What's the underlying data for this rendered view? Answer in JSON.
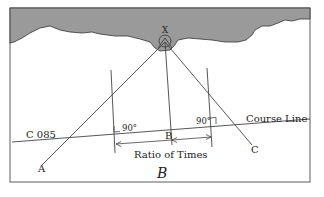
{
  "diagram": {
    "caption": "B",
    "object_label": "X",
    "course_label": "C 085",
    "course_line_label": "Course Line",
    "points": {
      "a": "A",
      "b": "B",
      "c": "C"
    },
    "angle_left": "90°",
    "angle_right": "90°",
    "ratio_label": "Ratio of Times",
    "colors": {
      "land": "#9a9a9a",
      "line": "#444444",
      "frame": "#777777"
    }
  }
}
